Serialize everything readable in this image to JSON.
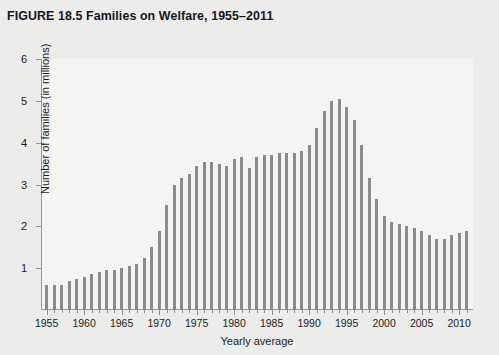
{
  "figure": {
    "title": "FIGURE 18.5  Families on Welfare, 1955–2011",
    "label": "FIGURE 18.5",
    "caption": "Families on Welfare, 1955–2011"
  },
  "colors": {
    "page_background": "#ececeb",
    "plot_background": "#f4f4f2",
    "bar": "#8b8b8a",
    "axis": "#9a9a98",
    "text": "#1d1d20"
  },
  "chart_data": {
    "type": "bar",
    "title": "Families on Welfare, 1955–2011",
    "xlabel": "Yearly average",
    "ylabel": "Number of families (in millions)",
    "ylim": [
      0,
      6
    ],
    "yticks": [
      1,
      2,
      3,
      4,
      5,
      6
    ],
    "ytick_labels": [
      "1",
      "2",
      "3",
      "4",
      "5",
      "6"
    ],
    "xlim": [
      1955,
      2011
    ],
    "xticks": [
      1955,
      1960,
      1965,
      1970,
      1975,
      1980,
      1985,
      1990,
      1995,
      2000,
      2005,
      2010
    ],
    "xtick_labels": [
      "1955",
      "1960",
      "1965",
      "1970",
      "1975",
      "1980",
      "1985",
      "1990",
      "1995",
      "2000",
      "2005",
      "2010"
    ],
    "grid": false,
    "legend": null,
    "units": "millions of families",
    "categories": [
      1955,
      1956,
      1957,
      1958,
      1959,
      1960,
      1961,
      1962,
      1963,
      1964,
      1965,
      1966,
      1967,
      1968,
      1969,
      1970,
      1971,
      1972,
      1973,
      1974,
      1975,
      1976,
      1977,
      1978,
      1979,
      1980,
      1981,
      1982,
      1983,
      1984,
      1985,
      1986,
      1987,
      1988,
      1989,
      1990,
      1991,
      1992,
      1993,
      1994,
      1995,
      1996,
      1997,
      1998,
      1999,
      2000,
      2001,
      2002,
      2003,
      2004,
      2005,
      2006,
      2007,
      2008,
      2009,
      2010,
      2011
    ],
    "values": [
      0.6,
      0.6,
      0.6,
      0.7,
      0.75,
      0.8,
      0.85,
      0.9,
      0.95,
      0.95,
      1.0,
      1.05,
      1.1,
      1.25,
      1.5,
      1.9,
      2.5,
      3.0,
      3.15,
      3.25,
      3.45,
      3.55,
      3.55,
      3.5,
      3.45,
      3.6,
      3.65,
      3.4,
      3.65,
      3.7,
      3.7,
      3.75,
      3.75,
      3.75,
      3.8,
      3.95,
      4.35,
      4.75,
      5.0,
      5.05,
      4.85,
      4.55,
      3.95,
      3.15,
      2.65,
      2.25,
      2.1,
      2.05,
      2.0,
      1.95,
      1.9,
      1.8,
      1.7,
      1.7,
      1.8,
      1.85,
      1.9
    ],
    "series": [
      {
        "name": "Families on welfare",
        "values": [
          0.6,
          0.6,
          0.6,
          0.7,
          0.75,
          0.8,
          0.85,
          0.9,
          0.95,
          0.95,
          1.0,
          1.05,
          1.1,
          1.25,
          1.5,
          1.9,
          2.5,
          3.0,
          3.15,
          3.25,
          3.45,
          3.55,
          3.55,
          3.5,
          3.45,
          3.6,
          3.65,
          3.4,
          3.65,
          3.7,
          3.7,
          3.75,
          3.75,
          3.75,
          3.8,
          3.95,
          4.35,
          4.75,
          5.0,
          5.05,
          4.85,
          4.55,
          3.95,
          3.15,
          2.65,
          2.25,
          2.1,
          2.05,
          2.0,
          1.95,
          1.9,
          1.8,
          1.7,
          1.7,
          1.8,
          1.85,
          1.9
        ]
      }
    ]
  }
}
